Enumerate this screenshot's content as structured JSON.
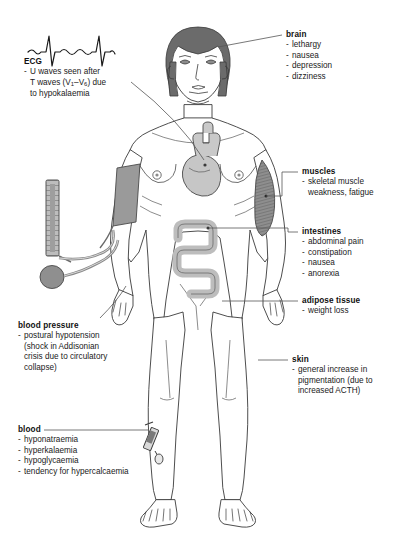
{
  "figure": {
    "colors": {
      "hair": "#6b6b6b",
      "cuff": "#9a9a9a",
      "organ_fill": "#cfcfcf",
      "muscle": "#8a8a8a",
      "outline": "#3a3a3a",
      "leader_line": "#555555",
      "text": "#1a1a1a"
    }
  },
  "callouts": {
    "ecg": {
      "heading": "ECG",
      "items": [
        "U waves seen after T waves (V1-V6) due to hypokalaemia"
      ],
      "line1": "U waves seen after",
      "line2a": "T waves (V",
      "line2b": "1",
      "line2c": "–V",
      "line2d": "6",
      "line2e": ") due",
      "line3": "to hypokalaemia",
      "icon": "ecg-waveform"
    },
    "brain": {
      "heading": "brain",
      "items": [
        "lethargy",
        "nausea",
        "depression",
        "dizziness"
      ]
    },
    "muscles": {
      "heading": "muscles",
      "items": [
        "skeletal muscle\nweakness, fatigue"
      ]
    },
    "intestines": {
      "heading": "intestines",
      "items": [
        "abdominal pain",
        "constipation",
        "nausea",
        "anorexia"
      ]
    },
    "adipose": {
      "heading": "adipose tissue",
      "items": [
        "weight loss"
      ]
    },
    "skin": {
      "heading": "skin",
      "items": [
        "general increase in\npigmentation (due to\nincreased ACTH)"
      ]
    },
    "blood_pressure": {
      "heading": "blood pressure",
      "items": [
        "postural hypotension\n(shock in Addisonian\ncrisis due to circulatory\ncollapse)"
      ]
    },
    "blood": {
      "heading": "blood",
      "items": [
        "hyponatraemia",
        "hyperkalaemia",
        "hypoglycaemia",
        "tendency for hypercalcaemia"
      ]
    }
  }
}
